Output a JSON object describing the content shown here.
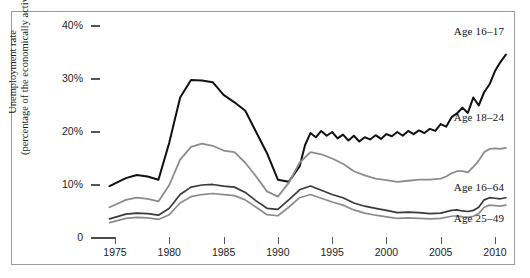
{
  "chart_data": {
    "type": "line",
    "title": "",
    "xlabel": "",
    "ylabel": "Unemployment rate (percentage of the economically active)",
    "ylabel_line1": "Unemployment rate",
    "ylabel_line2": "(percentage of the economically active)",
    "xlim": [
      1974,
      2011.5
    ],
    "ylim": [
      0,
      42
    ],
    "grid": false,
    "legend_position": "inline-right",
    "yticks": [
      0,
      10,
      20,
      30,
      40
    ],
    "ytick_labels": [
      "0",
      "10%",
      "20%",
      "30%",
      "40%"
    ],
    "xticks": [
      1975,
      1980,
      1985,
      1990,
      1995,
      2000,
      2005,
      2010
    ],
    "xtick_labels": [
      "1975",
      "1980",
      "1985",
      "1990",
      "1995",
      "2000",
      "2005",
      "2010"
    ],
    "series": [
      {
        "name": "Age 16-17",
        "label": "Age 16–17",
        "color": "#111111",
        "width": 2.0,
        "label_x": 2006.2,
        "label_y": 38.6,
        "x": [
          1974.5,
          1976,
          1977,
          1978,
          1979,
          1980,
          1981,
          1982,
          1983,
          1984,
          1985,
          1986,
          1987,
          1988,
          1989,
          1990,
          1991,
          1992,
          1992.5,
          1993,
          1993.5,
          1994,
          1994.5,
          1995,
          1995.5,
          1996,
          1996.5,
          1997,
          1997.5,
          1998,
          1998.5,
          1999,
          1999.5,
          2000,
          2000.5,
          2001,
          2001.5,
          2002,
          2002.5,
          2003,
          2003.5,
          2004,
          2004.5,
          2005,
          2005.5,
          2006,
          2006.5,
          2007,
          2007.5,
          2008,
          2008.5,
          2009,
          2009.5,
          2010,
          2010.5,
          2011
        ],
        "values": [
          9.8,
          11.3,
          11.9,
          11.6,
          11.0,
          18.0,
          26.5,
          29.8,
          29.7,
          29.4,
          27.0,
          25.6,
          24.0,
          20.0,
          16.0,
          11.0,
          10.6,
          13.5,
          17.5,
          19.8,
          19.0,
          20.2,
          19.3,
          20.0,
          18.8,
          19.5,
          18.4,
          19.3,
          18.2,
          19.0,
          18.6,
          19.4,
          18.7,
          19.6,
          19.2,
          20.0,
          19.3,
          20.2,
          19.6,
          20.3,
          19.8,
          20.6,
          20.2,
          21.5,
          21.0,
          22.8,
          23.5,
          24.6,
          23.6,
          26.5,
          25.0,
          27.5,
          29.0,
          31.5,
          33.2,
          34.6
        ]
      },
      {
        "name": "Age 18-24",
        "label": "Age 18–24",
        "color": "#8c8c8c",
        "width": 1.8,
        "label_x": 2006.2,
        "label_y": 22.5,
        "x": [
          1974.5,
          1976,
          1977,
          1978,
          1979,
          1980,
          1981,
          1982,
          1983,
          1984,
          1985,
          1986,
          1987,
          1988,
          1989,
          1990,
          1991,
          1992,
          1993,
          1994,
          1995,
          1996,
          1997,
          1998,
          1999,
          2000,
          2001,
          2002,
          2003,
          2004,
          2005,
          2005.5,
          2006,
          2006.5,
          2007,
          2007.5,
          2008,
          2008.5,
          2009,
          2009.5,
          2010,
          2010.5,
          2011
        ],
        "values": [
          5.8,
          7.2,
          7.6,
          7.4,
          6.9,
          10.0,
          14.8,
          17.2,
          17.8,
          17.4,
          16.5,
          16.2,
          14.2,
          11.6,
          8.8,
          7.8,
          10.4,
          14.2,
          16.2,
          15.8,
          15.0,
          14.0,
          12.6,
          11.8,
          11.2,
          10.9,
          10.6,
          10.8,
          11.0,
          11.0,
          11.2,
          11.6,
          12.2,
          12.6,
          12.6,
          12.4,
          13.4,
          14.6,
          16.2,
          16.8,
          16.9,
          16.8,
          17.0
        ]
      },
      {
        "name": "Age 16-64",
        "label": "Age 16–64",
        "color": "#3a3a3a",
        "width": 1.7,
        "label_x": 2006.2,
        "label_y": 9.2,
        "x": [
          1974.5,
          1976,
          1977,
          1978,
          1979,
          1980,
          1981,
          1982,
          1983,
          1984,
          1985,
          1986,
          1987,
          1988,
          1989,
          1990,
          1991,
          1992,
          1993,
          1994,
          1995,
          1996,
          1997,
          1998,
          1999,
          2000,
          2001,
          2002,
          2003,
          2004,
          2005,
          2006,
          2006.5,
          2007,
          2007.5,
          2008,
          2008.5,
          2009,
          2009.5,
          2010,
          2010.5,
          2011
        ],
        "values": [
          3.6,
          4.5,
          4.7,
          4.6,
          4.3,
          5.6,
          8.2,
          9.6,
          10.0,
          10.1,
          9.8,
          9.6,
          8.6,
          7.0,
          5.6,
          5.4,
          7.2,
          9.1,
          9.8,
          9.0,
          8.2,
          7.6,
          6.6,
          6.0,
          5.6,
          5.2,
          4.8,
          4.9,
          4.8,
          4.6,
          4.7,
          5.2,
          5.3,
          5.1,
          5.0,
          5.2,
          5.8,
          7.2,
          7.6,
          7.5,
          7.4,
          7.6
        ]
      },
      {
        "name": "Age 25-49",
        "label": "Age 25–49",
        "color": "#8c8c8c",
        "width": 1.7,
        "label_x": 2006.2,
        "label_y": 3.4,
        "x": [
          1974.5,
          1976,
          1977,
          1978,
          1979,
          1980,
          1981,
          1982,
          1983,
          1984,
          1985,
          1986,
          1987,
          1988,
          1989,
          1990,
          1991,
          1992,
          1993,
          1994,
          1995,
          1996,
          1997,
          1998,
          1999,
          2000,
          2001,
          2002,
          2003,
          2004,
          2005,
          2006,
          2006.5,
          2007,
          2007.5,
          2008,
          2008.5,
          2009,
          2009.5,
          2010,
          2010.5,
          2011
        ],
        "values": [
          2.9,
          3.7,
          3.9,
          3.8,
          3.5,
          4.4,
          6.6,
          7.8,
          8.2,
          8.4,
          8.2,
          8.0,
          7.2,
          5.8,
          4.4,
          4.2,
          5.8,
          7.6,
          8.2,
          7.5,
          6.8,
          6.2,
          5.3,
          4.7,
          4.3,
          4.0,
          3.7,
          3.8,
          3.7,
          3.6,
          3.7,
          4.1,
          4.2,
          4.0,
          3.9,
          4.1,
          4.6,
          5.8,
          6.2,
          6.1,
          6.0,
          6.2
        ]
      }
    ]
  }
}
